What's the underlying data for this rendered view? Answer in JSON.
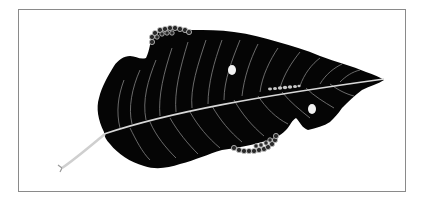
{
  "figure": {
    "description": "Engraved illustration of a dark leaf with pale veins, two caterpillars feeding along its edges, a small larva on the midrib, and two holes",
    "subjects": [
      {
        "name": "leaf",
        "color": "#050505"
      },
      {
        "name": "midrib",
        "color": "#d8d8d8"
      },
      {
        "name": "stem",
        "color": "#cfcfcf"
      },
      {
        "name": "caterpillar-top",
        "color": "#bdbdbd"
      },
      {
        "name": "caterpillar-bottom",
        "color": "#bdbdbd"
      },
      {
        "name": "larva-midrib",
        "color": "#c8c8c8"
      },
      {
        "name": "leaf-hole-1",
        "color": "#f2f2f2"
      },
      {
        "name": "leaf-hole-2",
        "color": "#f2f2f2"
      }
    ],
    "frame_border_color": "#8a8a8a",
    "background_color": "#ffffff"
  }
}
